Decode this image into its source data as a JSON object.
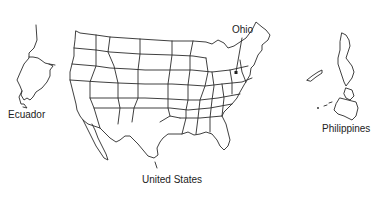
{
  "map": {
    "labels": {
      "ecuador": "Ecuador",
      "ohio": "Ohio",
      "united_states": "United States",
      "philippines": "Philippines"
    },
    "colors": {
      "background": "#ffffff",
      "outline": "#2a2a2a",
      "text": "#222222"
    }
  }
}
